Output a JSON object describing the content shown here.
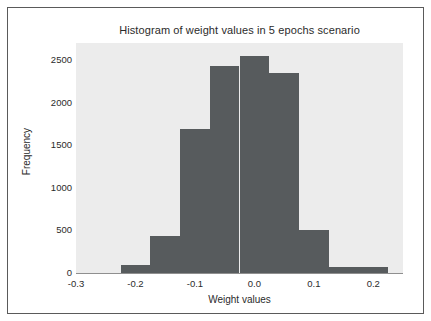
{
  "chart_data": {
    "type": "bar",
    "title": "Histogram of weight values in 5 epochs scenario",
    "xlabel": "Weight values",
    "ylabel": "Frequency",
    "xlim": [
      -0.3,
      0.25
    ],
    "ylim": [
      0,
      2700
    ],
    "grid": false,
    "legend": null,
    "bar_color": "#575b5d",
    "plot_bg_color": "#ececec",
    "figure_bg_color": "#ffffff",
    "xticks": [
      -0.3,
      -0.2,
      -0.1,
      0.0,
      0.1,
      0.2
    ],
    "xtick_labels": [
      "-0.3",
      "-0.2",
      "-0.1",
      "0.0",
      "0.1",
      "0.2"
    ],
    "yticks": [
      0,
      500,
      1000,
      1500,
      2000,
      2500
    ],
    "ytick_labels": [
      "0",
      "500",
      "1000",
      "1500",
      "2000",
      "2500"
    ],
    "bin_edges": [
      -0.225,
      -0.175,
      -0.125,
      -0.075,
      -0.025,
      0.025,
      0.075,
      0.125,
      0.175,
      0.225
    ],
    "bin_centers": [
      -0.2,
      -0.15,
      -0.1,
      -0.05,
      0.0,
      0.05,
      0.1,
      0.15,
      0.2
    ],
    "categories": [
      "-0.225 to -0.175",
      "-0.175 to -0.125",
      "-0.125 to -0.075",
      "-0.075 to -0.025",
      "-0.025 to 0.025",
      "0.025 to 0.075",
      "0.075 to 0.125",
      "0.125 to 0.175",
      "0.175 to 0.225"
    ],
    "values": [
      95,
      440,
      1690,
      2430,
      2550,
      2350,
      500,
      70,
      70
    ]
  }
}
